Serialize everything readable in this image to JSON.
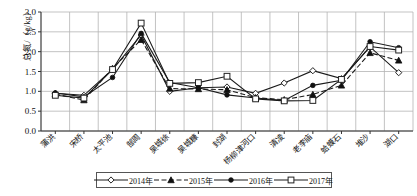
{
  "chart_data": {
    "type": "line",
    "title": "",
    "xlabel": "",
    "ylabel": "总氮/（g/kg）",
    "ylim": [
      0.0,
      3.0
    ],
    "ytick_step": 0.5,
    "yticks": [
      "0.0",
      "0.5",
      "1.0",
      "1.5",
      "2.0",
      "2.5",
      "3.0"
    ],
    "grid": true,
    "legend_position": "bottom",
    "categories": [
      "蒲洪",
      "宋桥",
      "太平池",
      "郜周",
      "吴城徐",
      "吴城糠",
      "封湖",
      "杨柳津河口",
      "清凌",
      "老李庙",
      "蛤蟆石",
      "堆沙",
      "湖口"
    ],
    "series": [
      {
        "name": "2014年",
        "marker": "open-diamond",
        "dash": "solid",
        "values": [
          0.95,
          0.9,
          1.55,
          2.42,
          1.0,
          1.09,
          1.11,
          0.95,
          1.21,
          1.52,
          1.32,
          2.12,
          1.47
        ]
      },
      {
        "name": "2015年",
        "marker": "filled-triangle",
        "dash": "dashed",
        "values": [
          0.93,
          0.78,
          1.58,
          2.3,
          1.07,
          1.06,
          1.04,
          0.84,
          0.79,
          0.92,
          1.15,
          1.97,
          1.78
        ]
      },
      {
        "name": "2016年",
        "marker": "filled-circle",
        "dash": "solid",
        "values": [
          0.96,
          0.86,
          1.35,
          2.46,
          1.22,
          1.09,
          0.91,
          0.83,
          0.77,
          1.15,
          1.28,
          2.25,
          2.1
        ]
      },
      {
        "name": "2017年",
        "marker": "open-square",
        "dash": "solid",
        "values": [
          0.9,
          0.83,
          1.55,
          2.72,
          1.2,
          1.22,
          1.38,
          0.81,
          0.76,
          0.77,
          1.3,
          2.13,
          2.04
        ]
      }
    ]
  }
}
